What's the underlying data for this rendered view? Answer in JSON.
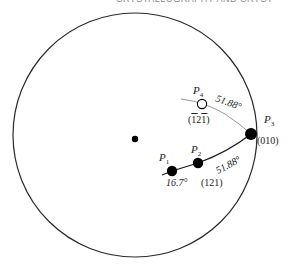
{
  "header": {
    "text": "CRYSTALLOGRAPHY AND CRYST"
  },
  "diagram": {
    "type": "stereographic-projection",
    "poles": [
      {
        "id": "P1",
        "name": "P",
        "sub": "1",
        "filled": true,
        "index": ""
      },
      {
        "id": "P2",
        "name": "P",
        "sub": "2",
        "filled": true,
        "index": "(121)"
      },
      {
        "id": "P3",
        "name": "P",
        "sub": "3",
        "filled": true,
        "index": "(010)"
      },
      {
        "id": "P4",
        "name": "P",
        "sub": "4",
        "filled": false,
        "index": "(̅2̅)"
      }
    ],
    "p4_index_parts": [
      "1",
      "2",
      "1"
    ],
    "angles": {
      "p1_p2": "16.7°",
      "p2_p3": "51.88°",
      "p3_p4": "51.88°"
    },
    "colors": {
      "primitive": "#2a2a2a",
      "great_circle_dark": "#1a1a1a",
      "great_circle_light": "#9a9a9a",
      "pole": "#000000"
    }
  }
}
